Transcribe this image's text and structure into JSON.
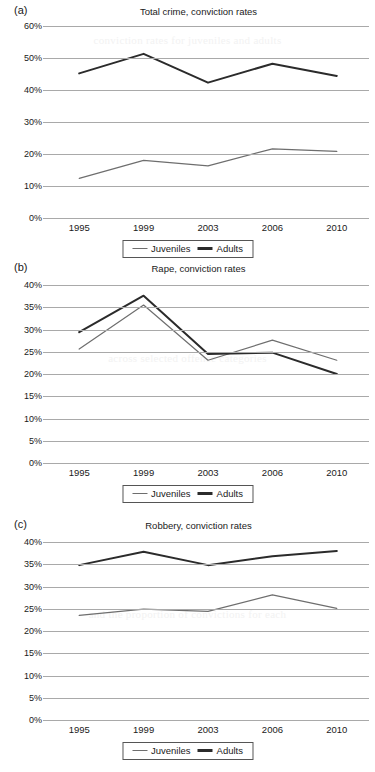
{
  "figure": {
    "series_names": [
      "Juveniles",
      "Adults"
    ],
    "series_colors": {
      "juveniles": "#6e6e6e",
      "adults": "#2b2b2b"
    },
    "categories": [
      "1995",
      "1999",
      "2003",
      "2006",
      "2010"
    ],
    "ghost_text": {
      "line1": "conviction rates for juveniles and adults",
      "line2": "across selected offence categories",
      "line3": "and the proportion of convictions for each"
    }
  },
  "panels": [
    {
      "tag": "(a)",
      "title": "Total crime, conviction rates",
      "yticks": [
        "0%",
        "10%",
        "20%",
        "30%",
        "40%",
        "50%",
        "60%"
      ],
      "legend": {
        "juveniles": "Juveniles",
        "adults": "Adults"
      }
    },
    {
      "tag": "(b)",
      "title": "Rape, conviction rates",
      "yticks": [
        "0%",
        "5%",
        "10%",
        "15%",
        "20%",
        "25%",
        "30%",
        "35%",
        "40%"
      ],
      "legend": {
        "juveniles": "Juveniles",
        "adults": "Adults"
      }
    },
    {
      "tag": "(c)",
      "title": "Robbery, conviction rates",
      "yticks": [
        "0%",
        "5%",
        "10%",
        "15%",
        "20%",
        "25%",
        "30%",
        "35%",
        "40%"
      ],
      "legend": {
        "juveniles": "Juveniles",
        "adults": "Adults"
      }
    }
  ],
  "chart_data": [
    {
      "type": "line",
      "panel": "(a)",
      "title": "Total crime, conviction rates",
      "xlabel": "",
      "ylabel": "",
      "categories": [
        "1995",
        "1999",
        "2003",
        "2006",
        "2010"
      ],
      "ylim": [
        0,
        60
      ],
      "ytick_step": 10,
      "grid": true,
      "legend_position": "bottom",
      "series": [
        {
          "name": "Juveniles",
          "color": "#6e6e6e",
          "values": [
            12.4,
            18.0,
            16.3,
            21.6,
            20.8
          ]
        },
        {
          "name": "Adults",
          "color": "#2b2b2b",
          "values": [
            45.2,
            51.3,
            42.3,
            48.2,
            44.4
          ]
        }
      ]
    },
    {
      "type": "line",
      "panel": "(b)",
      "title": "Rape, conviction rates",
      "xlabel": "",
      "ylabel": "",
      "categories": [
        "1995",
        "1999",
        "2003",
        "2006",
        "2010"
      ],
      "ylim": [
        0,
        40
      ],
      "ytick_step": 5,
      "grid": true,
      "legend_position": "bottom",
      "series": [
        {
          "name": "Juveniles",
          "color": "#6e6e6e",
          "values": [
            25.6,
            35.5,
            23.1,
            27.6,
            23.1
          ]
        },
        {
          "name": "Adults",
          "color": "#2b2b2b",
          "values": [
            29.4,
            37.6,
            24.5,
            24.8,
            20.0
          ]
        }
      ]
    },
    {
      "type": "line",
      "panel": "(c)",
      "title": "Robbery, conviction rates",
      "xlabel": "",
      "ylabel": "",
      "categories": [
        "1995",
        "1999",
        "2003",
        "2006",
        "2010"
      ],
      "ylim": [
        0,
        40
      ],
      "ytick_step": 5,
      "grid": true,
      "legend_position": "bottom",
      "series": [
        {
          "name": "Juveniles",
          "color": "#6e6e6e",
          "values": [
            23.5,
            24.9,
            24.4,
            28.1,
            25.1
          ]
        },
        {
          "name": "Adults",
          "color": "#2b2b2b",
          "values": [
            34.8,
            37.8,
            34.8,
            36.8,
            38.0
          ]
        }
      ]
    }
  ]
}
